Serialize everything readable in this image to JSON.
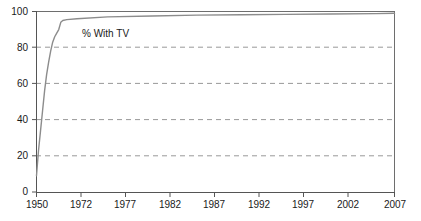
{
  "chart_data": {
    "type": "line",
    "title": "",
    "subtitle": "",
    "xlabel": "",
    "ylabel": "",
    "xlim": [
      1950,
      2007
    ],
    "ylim": [
      0,
      100
    ],
    "grid": true,
    "grid_axis": "y",
    "legend_position": "inline-annotation",
    "annotations": [
      {
        "text": "% With TV",
        "x": 1957,
        "y": 87
      }
    ],
    "x_tick_labels": [
      "1950",
      "1972",
      "1977",
      "1982",
      "1987",
      "1992",
      "1997",
      "2002",
      "2007"
    ],
    "x_tick_values": [
      1950,
      1972,
      1977,
      1982,
      1987,
      1992,
      1997,
      2002,
      2007
    ],
    "y_tick_labels": [
      "0",
      "20",
      "40",
      "60",
      "80",
      "100"
    ],
    "y_tick_values": [
      0,
      20,
      40,
      60,
      80,
      100
    ],
    "series": [
      {
        "name": "% With TV",
        "color": "#8c8c8c",
        "x": [
          1950,
          1951,
          1952,
          1953,
          1954,
          1955,
          1956,
          1957,
          1958,
          1959,
          1960,
          1961,
          1962,
          1963,
          1965,
          1970,
          1975,
          1980,
          1985,
          1990,
          1995,
          2000,
          2005,
          2007
        ],
        "values": [
          9,
          23,
          34,
          45,
          56,
          65,
          72,
          78,
          83,
          86,
          88,
          90,
          94,
          95,
          95.5,
          96,
          97,
          97.5,
          98,
          98.2,
          98.4,
          98.6,
          98.8,
          99
        ]
      }
    ]
  },
  "axis": {
    "x_labels": [
      "1950",
      "1972",
      "1977",
      "1982",
      "1987",
      "1992",
      "1997",
      "2002",
      "2007"
    ],
    "y_labels": [
      "100",
      "80",
      "60",
      "40",
      "20",
      "0"
    ]
  },
  "annotation": {
    "series_label": "% With TV"
  },
  "colors": {
    "line": "#8c8c8c",
    "grid": "#999999",
    "axis": "#555555",
    "text": "#1a1a1a",
    "background": "#ffffff"
  }
}
